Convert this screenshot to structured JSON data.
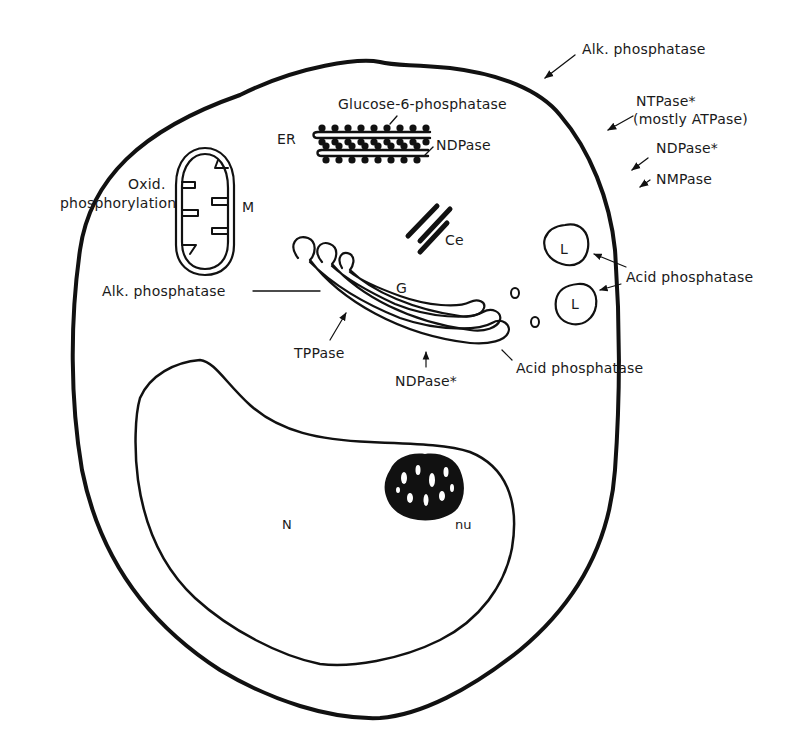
{
  "colors": {
    "ink": "#111111",
    "background": "#ffffff"
  },
  "organelles": {
    "endoplasmic_reticulum": "ER",
    "mitochondrion": "M",
    "centriole": "Ce",
    "golgi": "G",
    "lysosome_1": "L",
    "lysosome_2": "L",
    "nucleus": "N",
    "nucleolus": "nu"
  },
  "enzyme_labels": {
    "plasma_membrane": {
      "alk_phosphatase": "Alk. phosphatase",
      "ntpase": "NTPase*",
      "ntpase_note": "(mostly ATPase)",
      "ndpase": "NDPase*",
      "nmpase": "NMPase"
    },
    "er": {
      "glucose6": "Glucose-6-phosphatase",
      "ndpase": "NDPase"
    },
    "mitochondrion": {
      "line1": "Oxid.",
      "line2": "phosphorylation"
    },
    "golgi": {
      "alk_phosphatase": "Alk. phosphatase",
      "tppase": "TPPase",
      "ndpase": "NDPase*",
      "acid_phosphatase": "Acid phosphatase"
    },
    "lysosomes": {
      "acid_phosphatase": "Acid phosphatase"
    }
  }
}
